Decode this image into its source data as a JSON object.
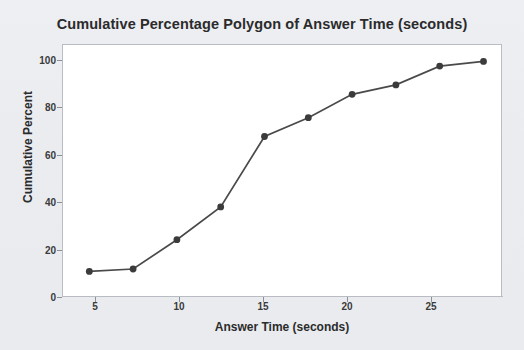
{
  "chart_data": {
    "type": "line",
    "title": "Cumulative Percentage Polygon of Answer Time (seconds)",
    "xlabel": "Answer Time (seconds)",
    "ylabel": "Cumulative Percent",
    "x": [
      5,
      7.5,
      10,
      12.5,
      15,
      17.5,
      20,
      22.5,
      25,
      27.5
    ],
    "values": [
      10.5,
      11.5,
      24,
      38,
      68,
      76,
      86,
      90,
      98,
      100
    ],
    "series": [
      {
        "name": "Cumulative Percent",
        "values": [
          10.5,
          11.5,
          24,
          38,
          68,
          76,
          86,
          90,
          98,
          100
        ]
      }
    ],
    "xlim": [
      3.5,
      28.5
    ],
    "ylim": [
      0,
      107
    ],
    "xticks": [
      5,
      10,
      15,
      20,
      25
    ],
    "xtick_labels": [
      "5",
      "10",
      "15",
      "20",
      "25"
    ],
    "yticks": [
      0,
      20,
      40,
      60,
      80,
      100
    ],
    "ytick_labels": [
      "0",
      "20",
      "40",
      "60",
      "80",
      "100"
    ],
    "grid": false,
    "legend": false,
    "marker": "circle",
    "line_color": "#4a4a4a",
    "marker_color": "#3b3b3b",
    "plot_background": "#ffffff",
    "figure_background": "#eceef2",
    "frame_color": "#b9bcc2"
  }
}
